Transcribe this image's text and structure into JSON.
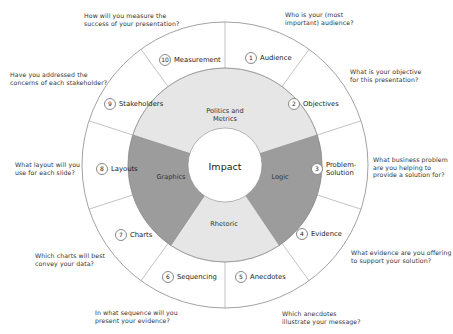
{
  "title_partial": "...y ...",
  "diagram": {
    "center": {
      "label": "Impact"
    },
    "inner_ring": [
      {
        "label": "Politics and\nMetrics",
        "line1": "Politics and",
        "line2": "Metrics",
        "color": "#e6e6e6"
      },
      {
        "label": "Logic",
        "line1": "Logic",
        "color": "#9c9c9c"
      },
      {
        "label": "Rhetoric",
        "line1": "Rhetoric",
        "color": "#e6e6e6"
      },
      {
        "label": "Graphics",
        "line1": "Graphics",
        "color": "#9c9c9c"
      }
    ],
    "outer_ring": [
      {
        "number": "1",
        "label": "Audience",
        "question": [
          "Who is your (most",
          "important) audience?"
        ]
      },
      {
        "number": "2",
        "label": "Objectives",
        "question": [
          "What is your objective",
          "for this presentation?"
        ]
      },
      {
        "number": "3",
        "label": "Problem-Solution",
        "label_lines": [
          "Problem-",
          "Solution"
        ],
        "question": [
          "What business problem",
          "are you helping to",
          "provide a solution for?"
        ]
      },
      {
        "number": "4",
        "label": "Evidence",
        "question": [
          "What evidence are you offering",
          "to support your solution?"
        ]
      },
      {
        "number": "5",
        "label": "Anecdotes",
        "question": [
          "Which anecdotes",
          "illustrate your message?"
        ]
      },
      {
        "number": "6",
        "label": "Sequencing",
        "question": [
          "In what sequence will you",
          "present your evidence?"
        ]
      },
      {
        "number": "7",
        "label": "Charts",
        "question": [
          "Which charts will best",
          "convey your data?"
        ]
      },
      {
        "number": "8",
        "label": "Layouts",
        "question": [
          "What layout will you",
          "use for each slide?"
        ]
      },
      {
        "number": "9",
        "label": "Stakeholders",
        "question": [
          "Have you addressed the",
          "concerns of each stakeholder?"
        ]
      },
      {
        "number": "10",
        "label": "Measurement",
        "question": [
          "How will you measure the",
          "success of your presentation?"
        ]
      }
    ],
    "colors": {
      "light_segment": "#e6e6e6",
      "dark_segment": "#9c9c9c",
      "outline": "#8a8a8a"
    }
  }
}
